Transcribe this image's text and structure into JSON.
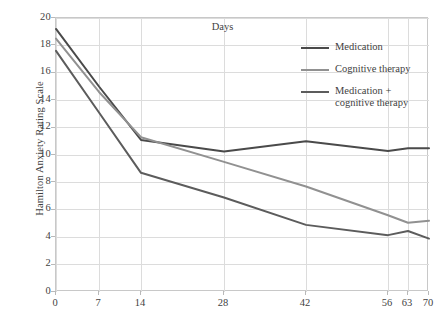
{
  "chart_data": {
    "type": "line",
    "title": "",
    "xlabel": "Days",
    "ylabel": "Hamilton Anxiety Rating Scale",
    "x": [
      0,
      7,
      14,
      28,
      42,
      56,
      63,
      70
    ],
    "x_tick_labels": [
      "0",
      "7",
      "14",
      "28",
      "42",
      "56",
      "63",
      "70"
    ],
    "x_tick_positions_px": [
      0,
      43,
      85,
      168,
      250,
      332,
      352,
      373
    ],
    "y_tick_labels": [
      "0",
      "2",
      "4",
      "6",
      "8",
      "10",
      "12",
      "14",
      "16",
      "18",
      "20"
    ],
    "ylim": [
      0,
      20
    ],
    "y_tick_step": 2,
    "grid": true,
    "legend_position": "upper-right-inside",
    "series": [
      {
        "name": "Medication",
        "color": "#4a4a4a",
        "values": [
          19.2,
          15.0,
          11.1,
          10.25,
          11.0,
          10.3,
          10.5,
          10.5
        ]
      },
      {
        "name": "Cognitive therapy",
        "color": "#919191",
        "values": [
          18.5,
          14.6,
          11.3,
          9.5,
          7.7,
          5.6,
          5.05,
          5.2
        ]
      },
      {
        "name": "Medication +\ncognitive therapy",
        "color": "#5c5c5c",
        "values": [
          17.6,
          13.1,
          8.7,
          6.9,
          4.9,
          4.15,
          4.45,
          3.9
        ]
      }
    ]
  },
  "axes": {
    "x_title": "Days",
    "y_title": "Hamilton Anxiety Rating Scale"
  },
  "legend": {
    "items": [
      {
        "label": "Medication",
        "color": "#4a4a4a"
      },
      {
        "label": "Cognitive therapy",
        "color": "#919191"
      },
      {
        "label": "Medication +\ncognitive therapy",
        "color": "#5c5c5c"
      }
    ]
  },
  "colors": {
    "grid": "#dcdcdc",
    "frame": "#c8c8c8",
    "text": "#3f3f3f",
    "background": "#ffffff"
  }
}
